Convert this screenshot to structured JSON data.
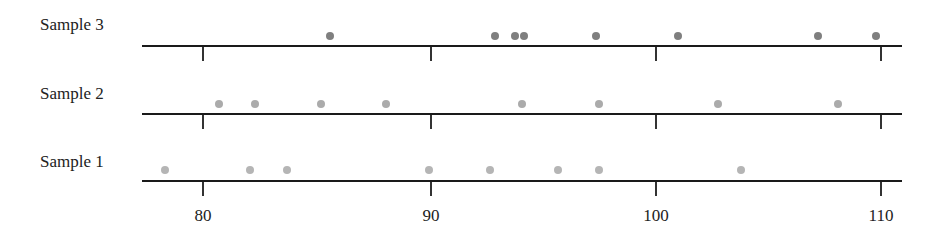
{
  "chart_data": {
    "type": "scatter",
    "subtype": "dot-plot",
    "title": "",
    "xlabel": "",
    "ylabel": "",
    "xlim": [
      77.3,
      111
    ],
    "x_ticks": [
      80,
      90,
      100,
      110
    ],
    "grid": false,
    "legend": null,
    "series": [
      {
        "name": "Sample 3",
        "color": "#7f7f7f",
        "values": [
          85.6,
          92.9,
          93.8,
          94.2,
          97.4,
          101.0,
          107.2,
          109.8
        ]
      },
      {
        "name": "Sample 2",
        "color": "#ababab",
        "values": [
          80.7,
          82.3,
          85.2,
          88.1,
          94.1,
          97.5,
          102.8,
          108.1
        ]
      },
      {
        "name": "Sample 1",
        "color": "#b5b5b5",
        "values": [
          78.3,
          82.1,
          83.7,
          90.0,
          92.7,
          95.7,
          97.5,
          103.8
        ]
      }
    ]
  },
  "labels": {
    "row3": "Sample 3",
    "row2": "Sample 2",
    "row1": "Sample 1",
    "tick80": "80",
    "tick90": "90",
    "tick100": "100",
    "tick110": "110"
  }
}
